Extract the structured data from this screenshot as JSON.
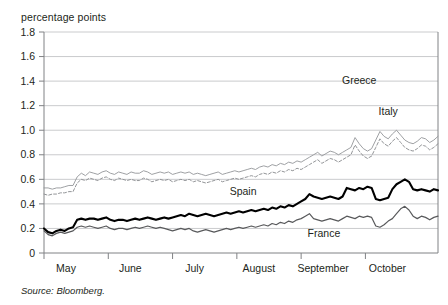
{
  "axis_unit_label": "percentage points",
  "source": {
    "label": "Source:",
    "text": "Bloomberg."
  },
  "colors": {
    "greece_line": "#939598",
    "italy_line": "#939598",
    "spain_line": "#000000",
    "france_line": "#58595b",
    "gridline": "#bcbec0",
    "axis": "#808285",
    "text": "#231f20"
  },
  "chart_data": {
    "type": "line",
    "title": "",
    "subtitle": "",
    "xlabel": "",
    "ylabel": "percentage points",
    "ylim": [
      0,
      1.8
    ],
    "yticks": [
      0,
      0.2,
      0.4,
      0.6,
      0.8,
      1.0,
      1.2,
      1.4,
      1.6,
      1.8
    ],
    "ytick_labels": [
      "0",
      "0.2",
      "0.4",
      "0.6",
      "0.8",
      "1.0",
      "1.2",
      "1.4",
      "1.6",
      "1.8"
    ],
    "grid": true,
    "grid_axis": "y",
    "legend_position": "inline-annotations",
    "categories": [
      "May",
      "June",
      "July",
      "August",
      "September",
      "October"
    ],
    "xtick_labels": [
      "May",
      "June",
      "July",
      "August",
      "September",
      "October"
    ],
    "xtick_positions": [
      0,
      31,
      62,
      93,
      124,
      155
    ],
    "xlim": [
      0,
      190
    ],
    "series": [
      {
        "name": "Greece",
        "style": "solid-thin",
        "color": "#939598",
        "label_x": 152,
        "label_y": 1.38,
        "x": [
          0,
          2,
          4,
          6,
          8,
          10,
          12,
          14,
          16,
          18,
          20,
          22,
          24,
          26,
          28,
          30,
          32,
          34,
          36,
          38,
          40,
          42,
          44,
          46,
          48,
          50,
          52,
          54,
          56,
          58,
          60,
          62,
          64,
          66,
          68,
          70,
          72,
          74,
          76,
          78,
          80,
          82,
          84,
          86,
          88,
          90,
          92,
          94,
          96,
          98,
          100,
          102,
          104,
          106,
          108,
          110,
          112,
          114,
          116,
          118,
          120,
          122,
          124,
          126,
          128,
          130,
          132,
          134,
          136,
          138,
          140,
          142,
          144,
          146,
          148,
          150,
          152,
          154,
          156,
          158,
          160,
          162,
          164,
          166,
          168,
          170,
          172,
          174,
          176,
          178,
          180,
          182,
          184,
          186,
          188,
          190
        ],
        "values": [
          0.53,
          0.53,
          0.52,
          0.53,
          0.53,
          0.54,
          0.55,
          0.55,
          0.62,
          0.65,
          0.63,
          0.66,
          0.65,
          0.64,
          0.66,
          0.67,
          0.65,
          0.64,
          0.66,
          0.65,
          0.64,
          0.66,
          0.65,
          0.65,
          0.67,
          0.66,
          0.64,
          0.65,
          0.66,
          0.65,
          0.66,
          0.64,
          0.65,
          0.66,
          0.65,
          0.66,
          0.64,
          0.65,
          0.64,
          0.63,
          0.64,
          0.65,
          0.66,
          0.64,
          0.65,
          0.66,
          0.67,
          0.66,
          0.67,
          0.68,
          0.69,
          0.68,
          0.7,
          0.71,
          0.7,
          0.72,
          0.71,
          0.73,
          0.72,
          0.74,
          0.73,
          0.75,
          0.74,
          0.76,
          0.78,
          0.8,
          0.82,
          0.79,
          0.81,
          0.83,
          0.82,
          0.8,
          0.82,
          0.84,
          0.86,
          0.94,
          0.89,
          0.85,
          0.83,
          0.85,
          0.92,
          0.99,
          0.95,
          0.93,
          0.97,
          1.0,
          0.96,
          0.92,
          0.9,
          0.89,
          0.91,
          0.94,
          0.93,
          0.9,
          0.92,
          0.95
        ]
      },
      {
        "name": "Italy",
        "style": "dashed",
        "color": "#939598",
        "label_x": 166,
        "label_y": 1.12,
        "x": [
          0,
          2,
          4,
          6,
          8,
          10,
          12,
          14,
          16,
          18,
          20,
          22,
          24,
          26,
          28,
          30,
          32,
          34,
          36,
          38,
          40,
          42,
          44,
          46,
          48,
          50,
          52,
          54,
          56,
          58,
          60,
          62,
          64,
          66,
          68,
          70,
          72,
          74,
          76,
          78,
          80,
          82,
          84,
          86,
          88,
          90,
          92,
          94,
          96,
          98,
          100,
          102,
          104,
          106,
          108,
          110,
          112,
          114,
          116,
          118,
          120,
          122,
          124,
          126,
          128,
          130,
          132,
          134,
          136,
          138,
          140,
          142,
          144,
          146,
          148,
          150,
          152,
          154,
          156,
          158,
          160,
          162,
          164,
          166,
          168,
          170,
          172,
          174,
          176,
          178,
          180,
          182,
          184,
          186,
          188,
          190
        ],
        "values": [
          0.48,
          0.47,
          0.48,
          0.48,
          0.49,
          0.49,
          0.5,
          0.5,
          0.57,
          0.6,
          0.59,
          0.61,
          0.6,
          0.59,
          0.61,
          0.62,
          0.6,
          0.59,
          0.61,
          0.6,
          0.59,
          0.6,
          0.59,
          0.59,
          0.61,
          0.6,
          0.58,
          0.59,
          0.6,
          0.59,
          0.6,
          0.58,
          0.59,
          0.6,
          0.59,
          0.6,
          0.58,
          0.59,
          0.58,
          0.57,
          0.58,
          0.59,
          0.6,
          0.58,
          0.59,
          0.6,
          0.61,
          0.6,
          0.61,
          0.62,
          0.63,
          0.62,
          0.64,
          0.65,
          0.64,
          0.66,
          0.65,
          0.67,
          0.66,
          0.68,
          0.67,
          0.69,
          0.68,
          0.7,
          0.72,
          0.74,
          0.76,
          0.73,
          0.75,
          0.77,
          0.76,
          0.74,
          0.76,
          0.78,
          0.8,
          0.88,
          0.83,
          0.79,
          0.77,
          0.79,
          0.86,
          0.93,
          0.89,
          0.87,
          0.91,
          0.94,
          0.9,
          0.86,
          0.84,
          0.83,
          0.85,
          0.88,
          0.87,
          0.84,
          0.86,
          0.89
        ]
      },
      {
        "name": "Spain",
        "style": "solid-thick",
        "color": "#000000",
        "label_x": 96,
        "label_y": 0.47,
        "x": [
          0,
          2,
          4,
          6,
          8,
          10,
          12,
          14,
          16,
          18,
          20,
          22,
          24,
          26,
          28,
          30,
          32,
          34,
          36,
          38,
          40,
          42,
          44,
          46,
          48,
          50,
          52,
          54,
          56,
          58,
          60,
          62,
          64,
          66,
          68,
          70,
          72,
          74,
          76,
          78,
          80,
          82,
          84,
          86,
          88,
          90,
          92,
          94,
          96,
          98,
          100,
          102,
          104,
          106,
          108,
          110,
          112,
          114,
          116,
          118,
          120,
          122,
          124,
          126,
          128,
          130,
          132,
          134,
          136,
          138,
          140,
          142,
          144,
          146,
          148,
          150,
          152,
          154,
          156,
          158,
          160,
          162,
          164,
          166,
          168,
          170,
          172,
          174,
          176,
          178,
          180,
          182,
          184,
          186,
          188,
          190
        ],
        "values": [
          0.2,
          0.17,
          0.16,
          0.18,
          0.19,
          0.18,
          0.2,
          0.21,
          0.27,
          0.28,
          0.27,
          0.28,
          0.28,
          0.27,
          0.28,
          0.29,
          0.27,
          0.26,
          0.27,
          0.27,
          0.26,
          0.27,
          0.28,
          0.27,
          0.28,
          0.29,
          0.28,
          0.27,
          0.28,
          0.29,
          0.28,
          0.29,
          0.3,
          0.31,
          0.3,
          0.32,
          0.31,
          0.3,
          0.31,
          0.32,
          0.31,
          0.3,
          0.31,
          0.32,
          0.33,
          0.32,
          0.33,
          0.34,
          0.33,
          0.34,
          0.35,
          0.34,
          0.35,
          0.36,
          0.35,
          0.37,
          0.36,
          0.38,
          0.37,
          0.39,
          0.38,
          0.4,
          0.42,
          0.44,
          0.48,
          0.46,
          0.45,
          0.44,
          0.45,
          0.46,
          0.45,
          0.44,
          0.46,
          0.53,
          0.52,
          0.51,
          0.53,
          0.52,
          0.54,
          0.53,
          0.44,
          0.43,
          0.44,
          0.45,
          0.52,
          0.56,
          0.58,
          0.6,
          0.58,
          0.52,
          0.51,
          0.52,
          0.51,
          0.5,
          0.52,
          0.51
        ]
      },
      {
        "name": "France",
        "style": "solid-medium",
        "color": "#58595b",
        "label_x": 135,
        "label_y": 0.13,
        "x": [
          0,
          2,
          4,
          6,
          8,
          10,
          12,
          14,
          16,
          18,
          20,
          22,
          24,
          26,
          28,
          30,
          32,
          34,
          36,
          38,
          40,
          42,
          44,
          46,
          48,
          50,
          52,
          54,
          56,
          58,
          60,
          62,
          64,
          66,
          68,
          70,
          72,
          74,
          76,
          78,
          80,
          82,
          84,
          86,
          88,
          90,
          92,
          94,
          96,
          98,
          100,
          102,
          104,
          106,
          108,
          110,
          112,
          114,
          116,
          118,
          120,
          122,
          124,
          126,
          128,
          130,
          132,
          134,
          136,
          138,
          140,
          142,
          144,
          146,
          148,
          150,
          152,
          154,
          156,
          158,
          160,
          162,
          164,
          166,
          168,
          170,
          172,
          174,
          176,
          178,
          180,
          182,
          184,
          186,
          188,
          190
        ],
        "values": [
          0.18,
          0.15,
          0.14,
          0.16,
          0.17,
          0.16,
          0.17,
          0.18,
          0.21,
          0.22,
          0.21,
          0.22,
          0.21,
          0.2,
          0.21,
          0.22,
          0.2,
          0.19,
          0.2,
          0.2,
          0.19,
          0.2,
          0.21,
          0.2,
          0.21,
          0.22,
          0.21,
          0.2,
          0.21,
          0.2,
          0.19,
          0.18,
          0.19,
          0.2,
          0.19,
          0.2,
          0.18,
          0.17,
          0.18,
          0.19,
          0.18,
          0.17,
          0.18,
          0.19,
          0.2,
          0.19,
          0.2,
          0.21,
          0.2,
          0.21,
          0.22,
          0.21,
          0.22,
          0.23,
          0.22,
          0.24,
          0.23,
          0.25,
          0.24,
          0.26,
          0.25,
          0.27,
          0.28,
          0.3,
          0.32,
          0.28,
          0.27,
          0.26,
          0.27,
          0.28,
          0.27,
          0.26,
          0.28,
          0.3,
          0.29,
          0.28,
          0.3,
          0.29,
          0.3,
          0.29,
          0.22,
          0.21,
          0.23,
          0.26,
          0.28,
          0.32,
          0.36,
          0.38,
          0.35,
          0.3,
          0.28,
          0.3,
          0.29,
          0.27,
          0.29,
          0.3
        ]
      }
    ],
    "annotations": [
      {
        "text": "Greece",
        "series": "Greece"
      },
      {
        "text": "Italy",
        "series": "Italy"
      },
      {
        "text": "Spain",
        "series": "Spain"
      },
      {
        "text": "France",
        "series": "France"
      }
    ]
  }
}
